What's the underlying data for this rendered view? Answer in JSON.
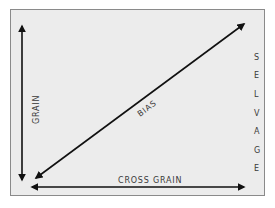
{
  "diagram": {
    "type": "fabric-grain-diagram",
    "labels": {
      "grain": "GRAIN",
      "bias": "BIAS",
      "cross_grain": "CROSS GRAIN",
      "selvage_letters": [
        "S",
        "E",
        "L",
        "V",
        "A",
        "G",
        "E"
      ]
    },
    "arrows": [
      {
        "name": "grain",
        "direction": "vertical",
        "heads": "both"
      },
      {
        "name": "bias",
        "direction": "diagonal",
        "heads": "both"
      },
      {
        "name": "cross-grain",
        "direction": "horizontal",
        "heads": "both"
      }
    ],
    "colors": {
      "background": "#ececec",
      "border": "#8a8a8a",
      "arrow": "#111111",
      "text": "#3a3a3a"
    }
  }
}
